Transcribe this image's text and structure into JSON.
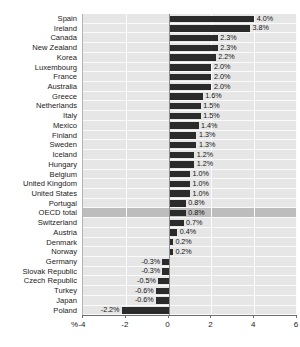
{
  "chart_data": {
    "type": "bar",
    "orientation": "horizontal",
    "title": "1995-2005",
    "xlabel": "%",
    "ylabel": "",
    "xlim": [
      -4,
      6
    ],
    "xticks": [
      -4,
      -2,
      0,
      2,
      4,
      6
    ],
    "xtick_labels": [
      "-4",
      "-2",
      "0",
      "2",
      "4",
      "6"
    ],
    "grid": true,
    "legend": false,
    "highlight_category": "OECD total",
    "bar_color": "#2b2b2b",
    "plot_background": "#e6e6e6",
    "highlight_band_color": "#bdbdbd",
    "gridline_color": "#fcfcfc",
    "categories": [
      "Spain",
      "Ireland",
      "Canada",
      "New Zealand",
      "Korea",
      "Luxembourg",
      "France",
      "Australia",
      "Greece",
      "Netherlands",
      "Italy",
      "Mexico",
      "Finland",
      "Sweden",
      "Iceland",
      "Hungary",
      "Belgium",
      "United Kingdom",
      "United States",
      "Portugal",
      "OECD total",
      "Switzerland",
      "Austria",
      "Denmark",
      "Norway",
      "Germany",
      "Slovak Republic",
      "Czech Republic",
      "Turkey",
      "Japan",
      "Poland"
    ],
    "values": [
      4.0,
      3.8,
      2.3,
      2.3,
      2.2,
      2.0,
      2.0,
      2.0,
      1.6,
      1.5,
      1.5,
      1.4,
      1.3,
      1.3,
      1.2,
      1.2,
      1.0,
      1.0,
      1.0,
      0.8,
      0.8,
      0.7,
      0.4,
      0.2,
      0.2,
      -0.3,
      -0.3,
      -0.5,
      -0.6,
      -0.6,
      -2.2
    ],
    "value_labels": [
      "4.0%",
      "3.8%",
      "2.3%",
      "2.3%",
      "2.2%",
      "2.0%",
      "2.0%",
      "2.0%",
      "1.6%",
      "1.5%",
      "1.5%",
      "1.4%",
      "1.3%",
      "1.3%",
      "1.2%",
      "1.2%",
      "1.0%",
      "1.0%",
      "1.0%",
      "0.8%",
      "0.8%",
      "0.7%",
      "0.4%",
      "0.2%",
      "0.2%",
      "-0.3%",
      "-0.3%",
      "-0.5%",
      "-0.6%",
      "-0.6%",
      "-2.2%"
    ]
  }
}
